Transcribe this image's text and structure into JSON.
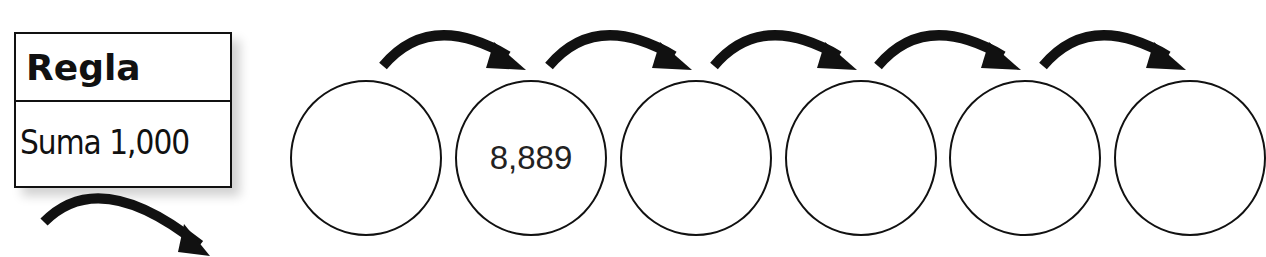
{
  "rule": {
    "title": "Regla",
    "text": "Suma 1,000"
  },
  "circles": [
    {
      "value": ""
    },
    {
      "value": "8,889"
    },
    {
      "value": ""
    },
    {
      "value": ""
    },
    {
      "value": ""
    },
    {
      "value": ""
    }
  ],
  "arrow_count": 5
}
